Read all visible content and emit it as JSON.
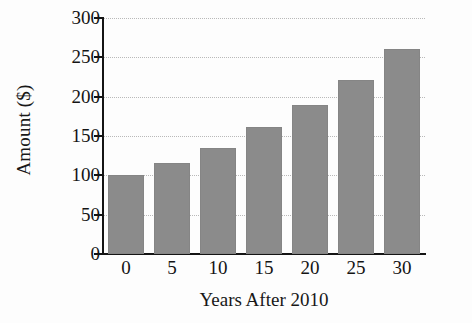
{
  "chart_data": {
    "type": "bar",
    "title": "",
    "subtitle": "",
    "xlabel": "Years After 2010",
    "ylabel": "Amount ($)",
    "categories": [
      "0",
      "5",
      "10",
      "15",
      "20",
      "25",
      "30"
    ],
    "values": [
      100,
      116,
      135,
      161,
      190,
      221,
      260
    ],
    "ylim": [
      0,
      300
    ],
    "yticks": [
      0,
      50,
      100,
      150,
      200,
      250,
      300
    ],
    "ytick_labels": [
      "0",
      "50",
      "100",
      "150",
      "200",
      "250",
      "300"
    ],
    "grid": true,
    "grid_axis": "y",
    "grid_style": "dotted",
    "legend": false,
    "legend_position": "none",
    "bar_color": "#8b8b8b",
    "axis_color": "#141414",
    "grid_color": "#b9b9b9",
    "background_color": "#fdfdfd",
    "annotations": []
  }
}
